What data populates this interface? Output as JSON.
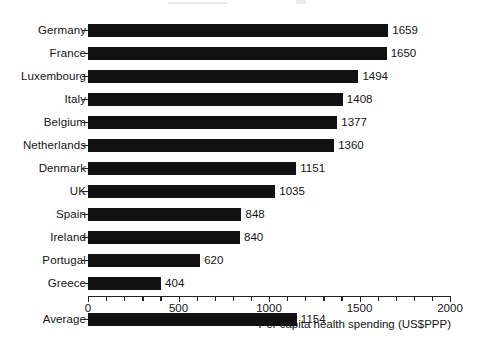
{
  "chart_data": {
    "type": "bar",
    "orientation": "horizontal",
    "title": "",
    "xlabel": "Per capita health spending (US$PPP)",
    "ylabel": "",
    "xlim": [
      0,
      2000
    ],
    "xticks": [
      0,
      500,
      1000,
      1500,
      2000
    ],
    "xtick_labels": [
      "0",
      "500",
      "1000",
      "1500",
      "2000"
    ],
    "minor_tick_interval": 100,
    "grid": false,
    "legend": null,
    "bar_color": "#111111",
    "categories": [
      "Germany",
      "France",
      "Luxembourg",
      "Italy",
      "Belgium",
      "Netherlands",
      "Denmark",
      "UK",
      "Spain",
      "Ireland",
      "Portugal",
      "Greece",
      "Average"
    ],
    "values": [
      1659,
      1650,
      1494,
      1408,
      1377,
      1360,
      1151,
      1035,
      848,
      840,
      620,
      404,
      1154
    ],
    "value_labels": [
      "1659",
      "1650",
      "1494",
      "1408",
      "1377",
      "1360",
      "1151",
      "1035",
      "848",
      "840",
      "620",
      "404",
      "1154"
    ],
    "separated_last_category": true,
    "annotation": "The last category 'Average' is offset below the country bars by an extra gap."
  }
}
